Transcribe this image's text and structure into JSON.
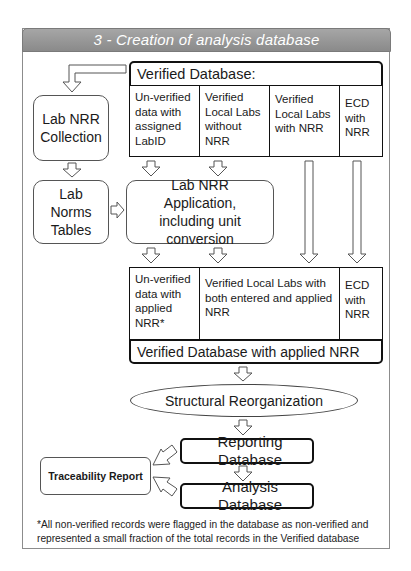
{
  "title": "3 - Creation of analysis database",
  "verified_database": {
    "header": "Verified Database:",
    "columns": [
      "Un-verified data with assigned LabID",
      "Verified Local Labs without NRR",
      "Verified Local Labs with NRR",
      "ECD with NRR"
    ]
  },
  "lab_nrr_collection": "Lab NRR Collection",
  "lab_norms_tables": "Lab Norms Tables",
  "lab_nrr_application": "Lab NRR Application, including unit conversion",
  "applied_row": {
    "columns": [
      "Un-verified data with applied NRR*",
      "Verified Local Labs with both entered and applied NRR",
      "ECD with NRR"
    ],
    "footer": "Verified Database with applied NRR"
  },
  "structural_reorganization": "Structural Reorganization",
  "reporting_database": "Reporting Database",
  "analysis_database": "Analysis Database",
  "traceability_report": "Traceability Report",
  "footnote": "*All non-verified records were flagged in the database as non-verified and represented a small fraction of the total records in the Verified database"
}
